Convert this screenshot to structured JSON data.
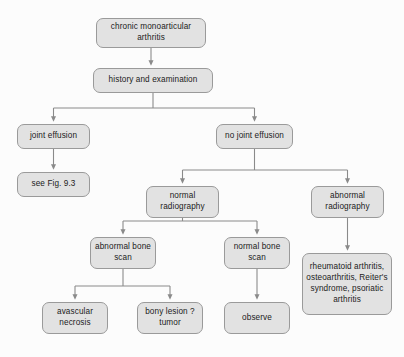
{
  "diagram": {
    "colors": {
      "node_fill": "#e2e2e2",
      "node_border": "#9a9a9a",
      "connector": "#8a8a8a",
      "background": "#fcfcfc",
      "text": "#1b1b1b"
    },
    "nodes": [
      {
        "id": "root",
        "label": "chronic monoarticular arthritis",
        "x": 96,
        "y": 18,
        "w": 110,
        "h": 30
      },
      {
        "id": "history",
        "label": "history and examination",
        "x": 93,
        "y": 68,
        "w": 120,
        "h": 25
      },
      {
        "id": "effusion",
        "label": "joint effusion",
        "x": 17,
        "y": 124,
        "w": 73,
        "h": 25
      },
      {
        "id": "see-fig",
        "label": "see Fig. 9.3",
        "x": 17,
        "y": 172,
        "w": 73,
        "h": 25
      },
      {
        "id": "no-effusion",
        "label": "no joint effusion",
        "x": 216,
        "y": 124,
        "w": 77,
        "h": 25
      },
      {
        "id": "normal-radio",
        "label": "normal radiography",
        "x": 146,
        "y": 186,
        "w": 73,
        "h": 32
      },
      {
        "id": "abnormal-radio",
        "label": "abnormal radiography",
        "x": 311,
        "y": 186,
        "w": 73,
        "h": 32
      },
      {
        "id": "abnormal-bone",
        "label": "abnormal bone scan",
        "x": 90,
        "y": 237,
        "w": 66,
        "h": 32
      },
      {
        "id": "normal-bone",
        "label": "normal bone scan",
        "x": 224,
        "y": 237,
        "w": 66,
        "h": 32
      },
      {
        "id": "avascular",
        "label": "avascular necrosis",
        "x": 42,
        "y": 302,
        "w": 66,
        "h": 32
      },
      {
        "id": "bony-lesion",
        "label": "bony lesion ? tumor",
        "x": 137,
        "y": 302,
        "w": 66,
        "h": 32
      },
      {
        "id": "observe",
        "label": "observe",
        "x": 224,
        "y": 302,
        "w": 66,
        "h": 32
      },
      {
        "id": "diagnoses",
        "label": "rheumatoid arthritis, osteoarthritis, Reiter's syndrome, psoriatic arthritis",
        "x": 302,
        "y": 253,
        "w": 90,
        "h": 62
      }
    ],
    "connectors": [
      {
        "id": "root-to-history",
        "from": "root",
        "to": "history"
      },
      {
        "id": "history-to-effusion",
        "from": "history",
        "to": "effusion"
      },
      {
        "id": "history-to-no-effusion",
        "from": "history",
        "to": "no-effusion"
      },
      {
        "id": "effusion-to-see-fig",
        "from": "effusion",
        "to": "see-fig"
      },
      {
        "id": "no-effusion-to-normal-radio",
        "from": "no-effusion",
        "to": "normal-radio"
      },
      {
        "id": "no-effusion-to-abnormal-radio",
        "from": "no-effusion",
        "to": "abnormal-radio"
      },
      {
        "id": "normal-radio-to-abnormal-bone",
        "from": "normal-radio",
        "to": "abnormal-bone"
      },
      {
        "id": "normal-radio-to-normal-bone",
        "from": "normal-radio",
        "to": "normal-bone"
      },
      {
        "id": "abnormal-radio-to-diagnoses",
        "from": "abnormal-radio",
        "to": "diagnoses"
      },
      {
        "id": "abnormal-bone-to-avascular",
        "from": "abnormal-bone",
        "to": "avascular"
      },
      {
        "id": "abnormal-bone-to-bony-lesion",
        "from": "abnormal-bone",
        "to": "bony-lesion"
      },
      {
        "id": "normal-bone-to-observe",
        "from": "normal-bone",
        "to": "observe"
      }
    ]
  }
}
